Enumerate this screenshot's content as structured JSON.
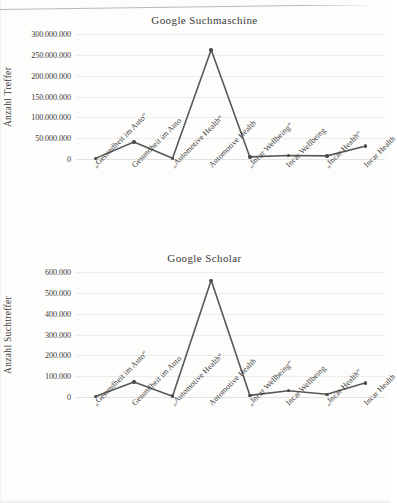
{
  "document": {
    "type": "scanned-figure-page",
    "background_color": "#fdfdfc",
    "line_color": "#585858",
    "marker_color": "#4b4b4b",
    "grid_color": "#ededee"
  },
  "categories": [
    "„Gesundheit im Auto“",
    "Gesundheit im Auto",
    "„Automotive Health“",
    "Automotive Health",
    "„Incar Wellbeing“",
    "Incar Wellbeing",
    "„Incar Health“",
    "Incar Health"
  ],
  "chart_data": [
    {
      "id": "google-suchmaschine",
      "type": "line",
      "title": "Google Suchmaschine",
      "xlabel": "",
      "ylabel": "Anzahl  Treffer",
      "ylim": [
        0,
        300000000
      ],
      "ytick_step": 50000000,
      "ytick_labels": [
        "300.000.000",
        "250.000.000",
        "200.000.000",
        "150.000.000",
        "100.000.000",
        "50.000.000",
        "0"
      ],
      "ytick_values": [
        300000000,
        250000000,
        200000000,
        150000000,
        100000000,
        50000000,
        0
      ],
      "grid": true,
      "legend": "none",
      "categories": [
        "„Gesundheit im Auto“",
        "Gesundheit im Auto",
        "„Automotive Health“",
        "Automotive Health",
        "„Incar Wellbeing“",
        "Incar Wellbeing",
        "„Incar Health“",
        "Incar Health"
      ],
      "values": [
        1500000,
        41000000,
        1800000,
        262000000,
        5000000,
        8500000,
        7500000,
        31000000
      ],
      "markers": true
    },
    {
      "id": "google-scholar",
      "type": "line",
      "title": "Google Scholar",
      "xlabel": "",
      "ylabel": "Anzahl  Suchtreffer",
      "ylim": [
        0,
        600000
      ],
      "ytick_step": 100000,
      "ytick_labels": [
        "600.000",
        "500.000",
        "400.000",
        "300.000",
        "200.000",
        "100.000",
        "0"
      ],
      "ytick_values": [
        600000,
        500000,
        400000,
        300000,
        200000,
        100000,
        0
      ],
      "grid": true,
      "legend": "none",
      "categories": [
        "„Gesundheit im Auto“",
        "Gesundheit im Auto",
        "„Automotive Health“",
        "Automotive Health",
        "„Incar Wellbeing“",
        "Incar Wellbeing",
        "„Incar Health“",
        "Incar Health"
      ],
      "values": [
        2000,
        72000,
        4000,
        560000,
        8000,
        30000,
        13000,
        68000
      ],
      "markers": true
    }
  ]
}
